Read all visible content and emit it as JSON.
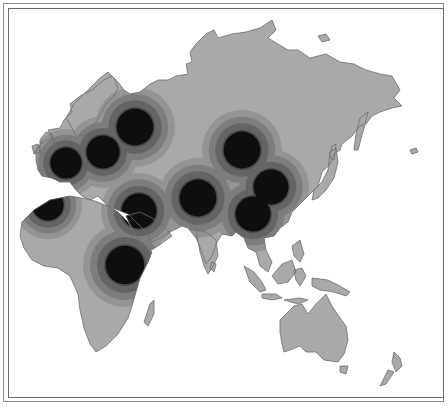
{
  "map": {
    "type": "thematic-density-map",
    "region": "Eurasia, Africa and Australia",
    "colors": {
      "background": "#ffffff",
      "land": "#a9a9a9",
      "coast": "#6d6d6d",
      "rings": [
        "#949494",
        "#7d7d7d",
        "#646464",
        "#4a4a4a",
        "#2e2e2e",
        "#0e0e0e"
      ]
    },
    "hotspots": [
      {
        "name": "western-europe",
        "cx": 66,
        "cy": 163,
        "r": 34
      },
      {
        "name": "central-europe",
        "cx": 103,
        "cy": 152,
        "r": 36
      },
      {
        "name": "western-russia",
        "cx": 135,
        "cy": 127,
        "r": 40
      },
      {
        "name": "north-africa-west",
        "cx": 48,
        "cy": 205,
        "r": 34
      },
      {
        "name": "middle-east",
        "cx": 139,
        "cy": 211,
        "r": 38
      },
      {
        "name": "east-africa",
        "cx": 125,
        "cy": 265,
        "r": 42
      },
      {
        "name": "central-asia",
        "cx": 198,
        "cy": 198,
        "r": 40
      },
      {
        "name": "mongolia-north-china",
        "cx": 242,
        "cy": 150,
        "r": 40
      },
      {
        "name": "east-china",
        "cx": 271,
        "cy": 187,
        "r": 38
      },
      {
        "name": "south-china",
        "cx": 253,
        "cy": 214,
        "r": 38
      }
    ]
  }
}
